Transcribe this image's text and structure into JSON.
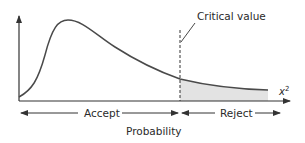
{
  "diagram": {
    "labels": {
      "critical_value": "Critical value",
      "accept": "Accept",
      "reject": "Reject",
      "x_axis": "Probability",
      "chi_symbol": "x",
      "chi_exponent": "2"
    },
    "colors": {
      "curve": "#4a4a4a",
      "axis": "#333333",
      "shaded_region": "#e3e3e3",
      "text": "#2a2a2a"
    },
    "regions": [
      {
        "name": "accept",
        "label": "Accept",
        "from": "origin",
        "to": "critical value"
      },
      {
        "name": "reject",
        "label": "Reject",
        "from": "critical value",
        "to": "infinity",
        "shaded": true
      }
    ]
  }
}
